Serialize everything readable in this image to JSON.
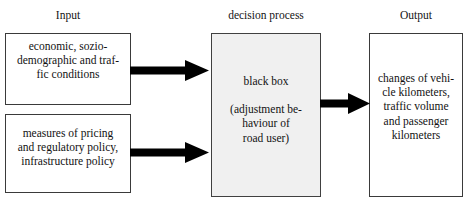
{
  "diagram": {
    "type": "flow-diagram",
    "columns": [
      {
        "id": "input",
        "header": "Input"
      },
      {
        "id": "decision_process",
        "header": "decision process"
      },
      {
        "id": "output",
        "header": "Output"
      }
    ],
    "boxes": [
      {
        "id": "input_conditions",
        "column": "input",
        "text": "economic, sozio-\ndemographic and traf-\nfic conditions",
        "fill": "#ffffff",
        "border": "#3a3a3a"
      },
      {
        "id": "input_policy",
        "column": "input",
        "text": "measures of pricing\nand regulatory policy,\ninfrastructure policy",
        "fill": "#ffffff",
        "border": "#3a3a3a"
      },
      {
        "id": "black_box",
        "column": "decision_process",
        "text_primary": "black box",
        "text_secondary": "(adjustment be-\nhaviour of\nroad user)",
        "fill": "#f0f0f0",
        "border": "#404040"
      },
      {
        "id": "output_changes",
        "column": "output",
        "text": "changes of vehi-\ncle kilometers,\ntraffic volume\nand passenger\nkilometers",
        "fill": "#ffffff",
        "border": "#3a3a3a"
      }
    ],
    "arrows": [
      {
        "id": "conditions_to_process",
        "from": "input_conditions",
        "to": "black_box",
        "color": "#000000"
      },
      {
        "id": "policy_to_process",
        "from": "input_policy",
        "to": "black_box",
        "color": "#000000"
      },
      {
        "id": "process_to_output",
        "from": "black_box",
        "to": "output_changes",
        "color": "#000000"
      }
    ]
  }
}
